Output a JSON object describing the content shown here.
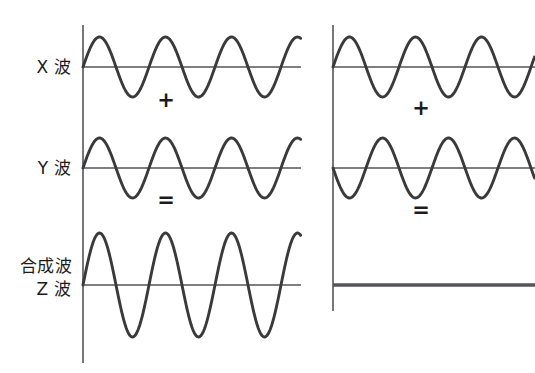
{
  "figure": {
    "title_strip": " ",
    "background_color": "#ffffff",
    "wave_color": "#3a3a3a",
    "axis_color": "#55555a",
    "text_color": "#1c1c1c",
    "width": 535,
    "height": 373
  },
  "labels": {
    "x_wave": "X 波",
    "y_wave": "Y 波",
    "z_wave": "合成波\nZ 波"
  },
  "operators": {
    "plus": "+",
    "equals": "="
  },
  "panels": [
    {
      "id": "left-panel",
      "name": "constructive-interference",
      "axis_x": 83,
      "wave_start": 83,
      "wave_end": 301,
      "rows": [
        {
          "id": "left-x-wave",
          "label_key": "x_wave",
          "baseline_y": 67,
          "amplitude": 30,
          "period": 66,
          "phase_deg": 0,
          "flat": false
        },
        {
          "id": "left-y-wave",
          "label_key": "y_wave",
          "baseline_y": 168,
          "amplitude": 30,
          "period": 66,
          "phase_deg": 0,
          "flat": false
        },
        {
          "id": "left-z-wave",
          "label_key": "z_wave",
          "baseline_y": 285,
          "amplitude": 52,
          "period": 66,
          "phase_deg": 0,
          "flat": false
        }
      ],
      "plus_x": 166,
      "plus_y": 100,
      "equals_x": 166,
      "equals_y": 200
    },
    {
      "id": "right-panel",
      "name": "destructive-interference",
      "axis_x": 333,
      "wave_start": 333,
      "wave_end": 535,
      "rows": [
        {
          "id": "right-x-wave",
          "label_key": "x_wave",
          "baseline_y": 67,
          "amplitude": 30,
          "period": 66,
          "phase_deg": 0,
          "flat": false
        },
        {
          "id": "right-y-wave",
          "label_key": "y_wave",
          "baseline_y": 168,
          "amplitude": 30,
          "period": 66,
          "phase_deg": 180,
          "flat": false
        },
        {
          "id": "right-z-wave",
          "label_key": "z_wave",
          "baseline_y": 285,
          "amplitude": 0,
          "period": 66,
          "phase_deg": 0,
          "flat": true
        }
      ],
      "plus_x": 421,
      "plus_y": 108,
      "equals_x": 421,
      "equals_y": 210
    }
  ],
  "chart_data": {
    "type": "line",
    "title": "",
    "xlabel": "",
    "ylabel": "",
    "grid": false,
    "legend": "none",
    "panels": [
      {
        "name": "constructive",
        "series": [
          {
            "name": "X 波",
            "amplitude": 1.0,
            "phase_deg": 0,
            "cycles": 3.3
          },
          {
            "name": "Y 波",
            "amplitude": 1.0,
            "phase_deg": 0,
            "cycles": 3.3
          },
          {
            "name": "合成波 Z 波",
            "amplitude": 2.0,
            "phase_deg": 0,
            "cycles": 3.3
          }
        ]
      },
      {
        "name": "destructive",
        "series": [
          {
            "name": "X 波",
            "amplitude": 1.0,
            "phase_deg": 0,
            "cycles": 3.1
          },
          {
            "name": "Y 波",
            "amplitude": 1.0,
            "phase_deg": 180,
            "cycles": 3.1
          },
          {
            "name": "合成波 Z 波",
            "amplitude": 0.0,
            "phase_deg": 0,
            "cycles": 0
          }
        ]
      }
    ]
  }
}
